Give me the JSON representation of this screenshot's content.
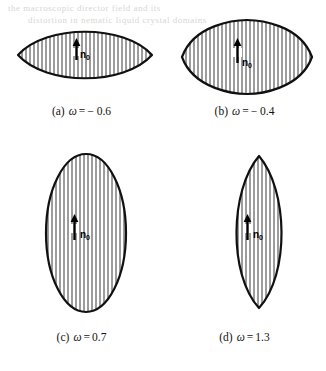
{
  "figure": {
    "background_color": "#ffffff",
    "ink_color": "#101010",
    "hatch_color": "#3a3a3a",
    "panel_count": 4,
    "director_label": "n",
    "director_subscript": "0",
    "director_arrow_direction": "up",
    "hatch_orientation": "vertical",
    "bleed_through_text": [
      "the macroscopic director field and its",
      "distortion in nematic liquid crystal domains"
    ]
  },
  "panels": [
    {
      "id": "panel-a",
      "index_label": "(a)",
      "omega_symbol": "ω",
      "equals": "=",
      "omega_value": "− 0.6",
      "shape": "lens-horizontal",
      "orientation": "horizontal",
      "pointed_at": "left-right",
      "box": {
        "x": 16,
        "y": 22,
        "w": 138,
        "h": 66
      },
      "caption_pos": {
        "x": 0,
        "y": 104
      },
      "arrow": {
        "x": 0.5,
        "y": 0.5
      }
    },
    {
      "id": "panel-b",
      "index_label": "(b)",
      "omega_symbol": "ω",
      "equals": "=",
      "omega_value": "− 0.4",
      "shape": "ellipse-horizontal-soft",
      "orientation": "horizontal",
      "pointed_at": "left-right-soft",
      "box": {
        "x": 180,
        "y": 18,
        "w": 134,
        "h": 78
      },
      "caption_pos": {
        "x": 163,
        "y": 104
      },
      "arrow": {
        "x": 0.5,
        "y": 0.5
      }
    },
    {
      "id": "panel-c",
      "index_label": "(c)",
      "omega_symbol": "ω",
      "equals": "=",
      "omega_value": "0.7",
      "shape": "ellipse-vertical",
      "orientation": "vertical",
      "pointed_at": "none",
      "box": {
        "x": 44,
        "y": 152,
        "w": 84,
        "h": 162
      },
      "caption_pos": {
        "x": 0,
        "y": 330
      },
      "arrow": {
        "x": 0.5,
        "y": 0.5
      }
    },
    {
      "id": "panel-d",
      "index_label": "(d)",
      "omega_symbol": "ω",
      "equals": "=",
      "omega_value": "1.3",
      "shape": "lens-vertical",
      "orientation": "vertical",
      "pointed_at": "top-bottom",
      "box": {
        "x": 226,
        "y": 154,
        "w": 66,
        "h": 156
      },
      "caption_pos": {
        "x": 163,
        "y": 330
      },
      "arrow": {
        "x": 0.5,
        "y": 0.5
      }
    }
  ]
}
